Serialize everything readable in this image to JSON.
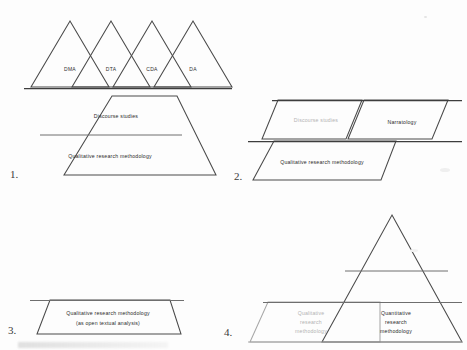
{
  "figure": {
    "background_color": "#fdfdfd",
    "ink_color": "#4a4a4a",
    "grey_ink_color": "#a8a8a8"
  },
  "panels": [
    {
      "number": "1.",
      "name": "panel-one",
      "triangles": [
        {
          "label": "DMA"
        },
        {
          "label": "DTA"
        },
        {
          "label": "CDA"
        },
        {
          "label": "DA"
        }
      ],
      "bands": [
        {
          "label": "Discourse studies",
          "color": "#2b2b2b"
        },
        {
          "label": "Qualitative research methodology",
          "color": "#2b2b2b"
        }
      ]
    },
    {
      "number": "2.",
      "name": "panel-two",
      "bands": [
        {
          "label": "Discourse studies",
          "color": "#b3b3b3"
        },
        {
          "label": "Narratology",
          "color": "#2b2b2b"
        },
        {
          "label": "Qualitative research methodology",
          "color": "#2b2b2b"
        }
      ]
    },
    {
      "number": "3.",
      "name": "panel-three",
      "bands": [
        {
          "label_line1": "Qualitative research methodology",
          "label_line2": "(as open textual analysis)",
          "color": "#2b2b2b"
        }
      ]
    },
    {
      "number": "4.",
      "name": "panel-four",
      "bands": [
        {
          "line1": "Qualitative",
          "line2": "research",
          "line3": "methodology",
          "color": "#b3b3b3"
        },
        {
          "line1": "Quantitative",
          "line2": "research",
          "line3": "methodology",
          "color": "#2b2b2b"
        }
      ]
    }
  ]
}
